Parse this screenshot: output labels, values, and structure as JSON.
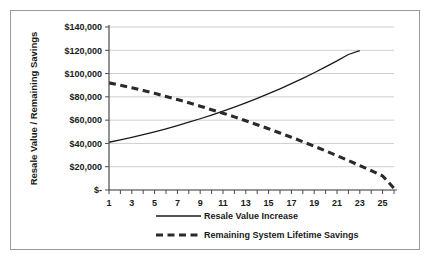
{
  "chart_data": {
    "type": "line",
    "title": "",
    "xlabel": "",
    "ylabel": "Resale Value / Remaining Savings",
    "xlim": [
      1,
      26
    ],
    "ylim": [
      0,
      140000
    ],
    "grid": true,
    "legend_position": "bottom",
    "y_tick_labels": [
      "$140,000",
      "$120,000",
      "$100,000",
      "$80,000",
      "$60,000",
      "$40,000",
      "$20,000",
      "$-"
    ],
    "y_tick_values": [
      140000,
      120000,
      100000,
      80000,
      60000,
      40000,
      20000,
      0
    ],
    "x_tick_labels": [
      "1",
      "3",
      "5",
      "7",
      "9",
      "11",
      "13",
      "15",
      "17",
      "19",
      "21",
      "23",
      "25"
    ],
    "x_tick_values": [
      1,
      3,
      5,
      7,
      9,
      11,
      13,
      15,
      17,
      19,
      21,
      23,
      25
    ],
    "x": [
      1,
      2,
      3,
      4,
      5,
      6,
      7,
      8,
      9,
      10,
      11,
      12,
      13,
      14,
      15,
      16,
      17,
      18,
      19,
      20,
      21,
      22,
      23,
      24,
      25,
      26
    ],
    "series": [
      {
        "name": "Resale Value Increase",
        "style": "solid",
        "color": "#1a1a1a",
        "values": [
          41000,
          43000,
          45200,
          47500,
          50000,
          52600,
          55300,
          58200,
          61200,
          64400,
          67700,
          71200,
          74900,
          78700,
          82700,
          86900,
          91300,
          95900,
          100700,
          105700,
          110900,
          116400,
          119800,
          null,
          null,
          null
        ]
      },
      {
        "name": "Remaining System Lifetime Savings",
        "style": "dashed",
        "color": "#2a2a2a",
        "values": [
          92000,
          90000,
          87800,
          85500,
          83000,
          80400,
          77700,
          74900,
          72000,
          69000,
          66000,
          62800,
          59500,
          56100,
          52600,
          49000,
          45300,
          41500,
          37600,
          33600,
          29500,
          25300,
          21000,
          16600,
          12100,
          1500
        ]
      }
    ],
    "legend": [
      {
        "label": "Resale Value Increase",
        "style": "solid"
      },
      {
        "label": "Remaining System Lifetime Savings",
        "style": "dashed"
      }
    ]
  }
}
